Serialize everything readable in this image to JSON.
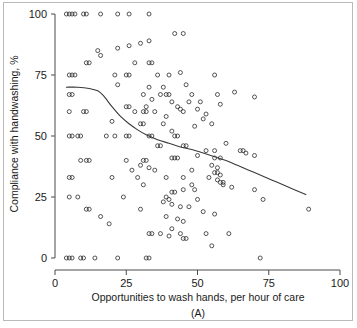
{
  "figure": {
    "panel_caption": "(A)",
    "background_color": "#ffffff",
    "border_color": "#b9b9b9",
    "marker_color": "#2b2b2b",
    "line_color": "#3a3a3a",
    "axis_color": "#4a4a4a"
  },
  "chart_data": {
    "type": "scatter",
    "title": "",
    "subtitle": "",
    "xlabel": "Opportunities to wash hands, per hour of care",
    "ylabel": "Compliance with handwashing, %",
    "annotation": "(A)",
    "xlim": [
      0,
      100
    ],
    "ylim": [
      0,
      100
    ],
    "xticks": [
      0,
      25,
      50,
      75,
      100
    ],
    "yticks": [
      0,
      25,
      50,
      75,
      100
    ],
    "xticklabels": [
      "0",
      "25",
      "50",
      "75",
      "100"
    ],
    "yticklabels": [
      "0",
      "25",
      "50",
      "75",
      "100"
    ],
    "grid": false,
    "legend": null,
    "legend_position": "none",
    "marker": "open-circle",
    "marker_size": 4,
    "series": [
      {
        "name": "Units observed",
        "type": "scatter",
        "points": [
          [
            4,
            100
          ],
          [
            5,
            100
          ],
          [
            6,
            100
          ],
          [
            7,
            100
          ],
          [
            10,
            100
          ],
          [
            11,
            100
          ],
          [
            16,
            100
          ],
          [
            22,
            100
          ],
          [
            26,
            100
          ],
          [
            33,
            100
          ],
          [
            42,
            92
          ],
          [
            45,
            92
          ],
          [
            33,
            89
          ],
          [
            30,
            88
          ],
          [
            26,
            87
          ],
          [
            22,
            86
          ],
          [
            15,
            85
          ],
          [
            16,
            83
          ],
          [
            11,
            80
          ],
          [
            12,
            80
          ],
          [
            28,
            80
          ],
          [
            33,
            80
          ],
          [
            34,
            80
          ],
          [
            5,
            75
          ],
          [
            6,
            75
          ],
          [
            7,
            75
          ],
          [
            21,
            75
          ],
          [
            25,
            75
          ],
          [
            26,
            75
          ],
          [
            36,
            75
          ],
          [
            40,
            75
          ],
          [
            44,
            76
          ],
          [
            56,
            75
          ],
          [
            22,
            71
          ],
          [
            33,
            70
          ],
          [
            38,
            70
          ],
          [
            46,
            71
          ],
          [
            5,
            67
          ],
          [
            6,
            67
          ],
          [
            31,
            67
          ],
          [
            37,
            67
          ],
          [
            39,
            67
          ],
          [
            40,
            67
          ],
          [
            48,
            67
          ],
          [
            57,
            67
          ],
          [
            63,
            68
          ],
          [
            70,
            66
          ],
          [
            34,
            65
          ],
          [
            41,
            64
          ],
          [
            47,
            64
          ],
          [
            51,
            64
          ],
          [
            58,
            63
          ],
          [
            25,
            62
          ],
          [
            26,
            62
          ],
          [
            32,
            62
          ],
          [
            43,
            62
          ],
          [
            44,
            61
          ],
          [
            50,
            61
          ],
          [
            5,
            60
          ],
          [
            10,
            60
          ],
          [
            11,
            60
          ],
          [
            28,
            60
          ],
          [
            31,
            60
          ],
          [
            32,
            60
          ],
          [
            35,
            60
          ],
          [
            45,
            60
          ],
          [
            53,
            59
          ],
          [
            39,
            58
          ],
          [
            52,
            57
          ],
          [
            20,
            56
          ],
          [
            55,
            55
          ],
          [
            30,
            55
          ],
          [
            31,
            55
          ],
          [
            38,
            55
          ],
          [
            49,
            54
          ],
          [
            41,
            52
          ],
          [
            5,
            50
          ],
          [
            6,
            50
          ],
          [
            8,
            50
          ],
          [
            9,
            50
          ],
          [
            18,
            50
          ],
          [
            21,
            50
          ],
          [
            25,
            50
          ],
          [
            26,
            50
          ],
          [
            33,
            50
          ],
          [
            34,
            50
          ],
          [
            42,
            50
          ],
          [
            43,
            50
          ],
          [
            36,
            46
          ],
          [
            37,
            46
          ],
          [
            45,
            46
          ],
          [
            46,
            46
          ],
          [
            60,
            47
          ],
          [
            53,
            44
          ],
          [
            56,
            44
          ],
          [
            65,
            44
          ],
          [
            66,
            44
          ],
          [
            67,
            43
          ],
          [
            70,
            42
          ],
          [
            11,
            40
          ],
          [
            12,
            40
          ],
          [
            25,
            40
          ],
          [
            31,
            40
          ],
          [
            32,
            40
          ],
          [
            41,
            41
          ],
          [
            42,
            41
          ],
          [
            43,
            41
          ],
          [
            50,
            42
          ],
          [
            56,
            41
          ],
          [
            58,
            41
          ],
          [
            9,
            40
          ],
          [
            30,
            38
          ],
          [
            33,
            37
          ],
          [
            55,
            38
          ],
          [
            57,
            37
          ],
          [
            27,
            36
          ],
          [
            35,
            36
          ],
          [
            48,
            36
          ],
          [
            56,
            35
          ],
          [
            57,
            35
          ],
          [
            58,
            34
          ],
          [
            5,
            33
          ],
          [
            6,
            33
          ],
          [
            20,
            33
          ],
          [
            29,
            33
          ],
          [
            39,
            33
          ],
          [
            45,
            33
          ],
          [
            54,
            33
          ],
          [
            57,
            32
          ],
          [
            58,
            31
          ],
          [
            59,
            31
          ],
          [
            59,
            30
          ],
          [
            48,
            30
          ],
          [
            31,
            30
          ],
          [
            62,
            29
          ],
          [
            41,
            27
          ],
          [
            42,
            27
          ],
          [
            45,
            28
          ],
          [
            49,
            28
          ],
          [
            70,
            28
          ],
          [
            5,
            25
          ],
          [
            8,
            25
          ],
          [
            24,
            25
          ],
          [
            39,
            25
          ],
          [
            40,
            24
          ],
          [
            50,
            24
          ],
          [
            73,
            24
          ],
          [
            38,
            23
          ],
          [
            41,
            22
          ],
          [
            44,
            21
          ],
          [
            47,
            21
          ],
          [
            11,
            20
          ],
          [
            12,
            20
          ],
          [
            30,
            20
          ],
          [
            89,
            20
          ],
          [
            52,
            19
          ],
          [
            56,
            18
          ],
          [
            39,
            17
          ],
          [
            43,
            16
          ],
          [
            45,
            15
          ],
          [
            16,
            17
          ],
          [
            19,
            14
          ],
          [
            41,
            12
          ],
          [
            33,
            10
          ],
          [
            34,
            10
          ],
          [
            37,
            10
          ],
          [
            44,
            10
          ],
          [
            53,
            10
          ],
          [
            61,
            10
          ],
          [
            40,
            9
          ],
          [
            45,
            8
          ],
          [
            46,
            8
          ],
          [
            55,
            5
          ],
          [
            4,
            0
          ],
          [
            5,
            0
          ],
          [
            6,
            0
          ],
          [
            9,
            0
          ],
          [
            10,
            0
          ],
          [
            14,
            0
          ],
          [
            22,
            0
          ],
          [
            32,
            0
          ],
          [
            33,
            0
          ],
          [
            72,
            0
          ]
        ]
      },
      {
        "name": "Smoothed trend",
        "type": "line",
        "points": [
          [
            4,
            70
          ],
          [
            8,
            70
          ],
          [
            12,
            69.5
          ],
          [
            15,
            68.5
          ],
          [
            17,
            66.5
          ],
          [
            20,
            62
          ],
          [
            23,
            58
          ],
          [
            26,
            55
          ],
          [
            29,
            52.5
          ],
          [
            32,
            50.5
          ],
          [
            36,
            48.5
          ],
          [
            40,
            47
          ],
          [
            44,
            45.5
          ],
          [
            48,
            44.5
          ],
          [
            52,
            43
          ],
          [
            56,
            41.5
          ],
          [
            60,
            40
          ],
          [
            64,
            38
          ],
          [
            68,
            36
          ],
          [
            72,
            34
          ],
          [
            76,
            32
          ],
          [
            80,
            30
          ],
          [
            84,
            28
          ],
          [
            88,
            26
          ]
        ]
      }
    ]
  },
  "axes": {
    "x_title": "Opportunities to wash hands, per hour of care",
    "y_title": "Compliance with handwashing, %",
    "x_tick_labels": [
      "0",
      "25",
      "50",
      "75",
      "100"
    ],
    "y_tick_labels": [
      "0",
      "25",
      "50",
      "75",
      "100"
    ]
  }
}
